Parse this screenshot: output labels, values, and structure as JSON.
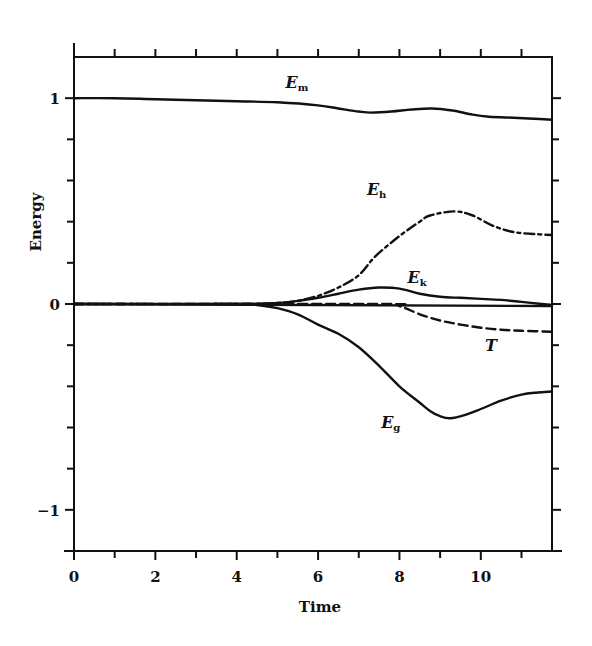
{
  "chart_data": {
    "type": "line",
    "title": "",
    "xlabel": "Time",
    "ylabel": "Energy",
    "xlim": [
      0,
      11.75
    ],
    "ylim": [
      -1.2,
      1.2
    ],
    "x_ticks_major": [
      0,
      2,
      4,
      6,
      8,
      10
    ],
    "x_tick_labels": [
      "0",
      "2",
      "4",
      "6",
      "8",
      "10"
    ],
    "x_ticks_minor_step": 1,
    "y_ticks_major": [
      -1,
      0,
      1
    ],
    "y_tick_labels": [
      "−1",
      "0",
      "1"
    ],
    "y_ticks_minor_step": 0.2,
    "grid": false,
    "legend": "inline labels",
    "series": [
      {
        "name": "E_m",
        "label_main": "E",
        "label_sub": "m",
        "style": "solid",
        "label_pos": [
          5.2,
          1.05
        ],
        "x": [
          0,
          1,
          2,
          3,
          4,
          5,
          6,
          6.5,
          7,
          7.3,
          7.8,
          8.3,
          8.8,
          9.3,
          9.8,
          10.2,
          10.8,
          11.3,
          11.75
        ],
        "y": [
          1.0,
          1.0,
          0.995,
          0.99,
          0.985,
          0.98,
          0.965,
          0.95,
          0.935,
          0.93,
          0.935,
          0.945,
          0.95,
          0.94,
          0.92,
          0.91,
          0.905,
          0.9,
          0.895
        ]
      },
      {
        "name": "E_h",
        "label_main": "E",
        "label_sub": "h",
        "style": "dashdot",
        "label_pos": [
          7.2,
          0.53
        ],
        "x": [
          0,
          4,
          5,
          5.5,
          6,
          6.5,
          7,
          7.4,
          8,
          8.5,
          8.75,
          9.35,
          9.8,
          10.3,
          10.8,
          11.3,
          11.75
        ],
        "y": [
          0,
          0,
          0.005,
          0.015,
          0.04,
          0.08,
          0.14,
          0.23,
          0.33,
          0.4,
          0.43,
          0.45,
          0.43,
          0.38,
          0.35,
          0.34,
          0.335
        ]
      },
      {
        "name": "E_k",
        "label_main": "E",
        "label_sub": "k",
        "style": "solid",
        "label_pos": [
          8.2,
          0.1
        ],
        "x": [
          0,
          4,
          5,
          5.5,
          6,
          6.5,
          7,
          7.5,
          8,
          8.5,
          9,
          9.5,
          10,
          10.5,
          11,
          11.5,
          11.75
        ],
        "y": [
          0,
          0,
          0.005,
          0.015,
          0.03,
          0.05,
          0.07,
          0.08,
          0.075,
          0.05,
          0.035,
          0.03,
          0.025,
          0.02,
          0.01,
          0.0,
          -0.005
        ]
      },
      {
        "name": "zero",
        "label_main": "",
        "label_sub": "",
        "style": "solid",
        "x": [
          0,
          11.75
        ],
        "y": [
          0,
          -0.01
        ]
      },
      {
        "name": "T",
        "label_main": "T",
        "label_sub": "",
        "style": "dashed",
        "label_pos": [
          10.1,
          -0.23
        ],
        "x": [
          0,
          7.5,
          8,
          8.5,
          9,
          9.5,
          10,
          10.5,
          11,
          11.75
        ],
        "y": [
          0,
          0,
          -0.01,
          -0.05,
          -0.08,
          -0.1,
          -0.115,
          -0.125,
          -0.13,
          -0.135
        ]
      },
      {
        "name": "E_g",
        "label_main": "E",
        "label_sub": "g",
        "style": "solid",
        "label_pos": [
          7.55,
          -0.6
        ],
        "x": [
          0,
          4,
          4.5,
          5,
          5.5,
          6,
          6.5,
          7,
          7.5,
          8,
          8.5,
          8.75,
          9,
          9.25,
          9.6,
          10,
          10.5,
          11,
          11.4,
          11.75
        ],
        "y": [
          0,
          0,
          -0.005,
          -0.02,
          -0.05,
          -0.1,
          -0.145,
          -0.21,
          -0.3,
          -0.4,
          -0.48,
          -0.52,
          -0.545,
          -0.555,
          -0.54,
          -0.51,
          -0.47,
          -0.44,
          -0.43,
          -0.425
        ]
      }
    ]
  },
  "axes": {
    "x_title": "Time",
    "y_title": "Energy"
  }
}
